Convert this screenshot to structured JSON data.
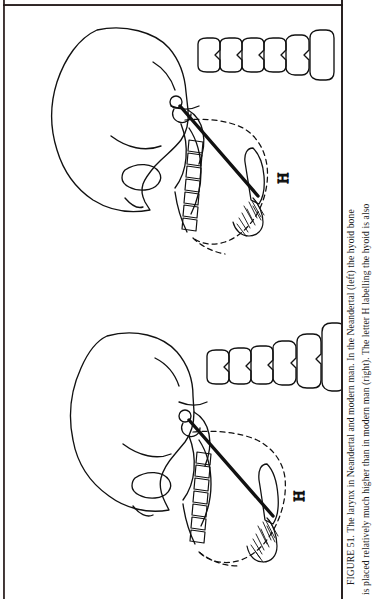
{
  "page": {
    "kind": "scanned-book-page",
    "background_color": "#ffffff",
    "ink_color": "#111111",
    "edge_color": "#1c1414"
  },
  "caption": {
    "figure_number": "FIGURE 51.",
    "line1": "FIGURE 51.   The larynx in Neandertal and modern man.   In the Neandertal (left) the hyoid bone",
    "line2": "is placed relatively much higher than in modern man (right).   The letter H labelling the hyoid is also",
    "sentence1": "The larynx in Neandertal and modern man.",
    "sentence2": "In the Neandertal (left) the hyoid bone is placed relatively much higher than in modern man (right).",
    "sentence3": "The letter H labelling the hyoid is also"
  },
  "figure": {
    "title": "The larynx in Neandertal and modern man",
    "orientation": "rotated-90-ccw",
    "panels": [
      {
        "id": "panel-left",
        "name": "neandertal-skull",
        "subject": "Neandertal",
        "position_note": "left",
        "hyoid_label": "H",
        "vertebrae_count": 6,
        "teeth_count": 7,
        "features": [
          "cranium",
          "mandible",
          "maxillary teeth",
          "cervical vertebrae",
          "hyoid bone",
          "larynx dashed outline",
          "styloid process line"
        ]
      },
      {
        "id": "panel-right",
        "name": "modern-man-skull",
        "subject": "modern man",
        "position_note": "right",
        "hyoid_label": "H",
        "vertebrae_count": 6,
        "teeth_count": 7,
        "features": [
          "cranium",
          "mandible",
          "maxillary teeth",
          "cervical vertebrae",
          "hyoid bone",
          "larynx dashed outline",
          "styloid process line"
        ]
      }
    ]
  }
}
